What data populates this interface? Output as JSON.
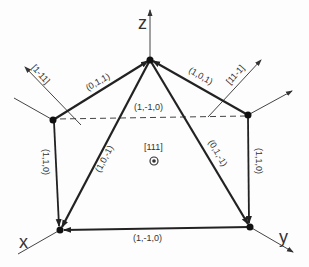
{
  "diagram": {
    "axes": {
      "z_label": "z",
      "x_label": "x",
      "y_label": "y"
    },
    "directions": {
      "upper_left": "[1-11]",
      "upper_right": "[11-1]",
      "center": "[111]"
    },
    "edges": {
      "left_to_top": "(0,1,1)",
      "right_to_top": "(1,0,1)",
      "right_to_left_dashed": "(1,-1,0)",
      "top_to_x": "(1,0,-1)",
      "top_to_y": "(0,1,-1)",
      "left_to_x": "(1,1,0)",
      "right_to_y": "(1,1,0)",
      "y_to_x": "(1,-1,0)"
    },
    "colors": {
      "line": "#222222",
      "thin_line": "#444444",
      "text": "#333333"
    }
  }
}
